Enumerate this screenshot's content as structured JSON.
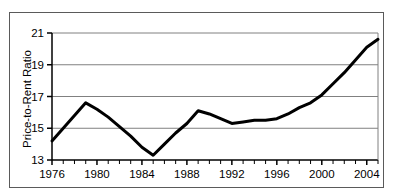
{
  "chart_data": {
    "type": "line",
    "title": "",
    "xlabel": "",
    "ylabel": "Price-to-Rent Ratio",
    "xlim": [
      1976,
      2005
    ],
    "ylim": [
      13,
      21
    ],
    "yticks": [
      13,
      15,
      17,
      19,
      21
    ],
    "ytick_labels": [
      "13",
      "15",
      "17",
      "19",
      "21"
    ],
    "xticks": [
      1976,
      1980,
      1984,
      1988,
      1992,
      1996,
      2000,
      2004
    ],
    "xtick_labels": [
      "1976",
      "1980",
      "1984",
      "1988",
      "1992",
      "1996",
      "2000",
      "2004"
    ],
    "minor_xtick_interval": 1,
    "grid": "horizontal",
    "legend": "none",
    "line_color": "#000000",
    "line_width_px": 3,
    "series": [
      {
        "name": "Price-to-Rent Ratio",
        "x": [
          1976,
          1977,
          1978,
          1979,
          1980,
          1981,
          1982,
          1983,
          1984,
          1985,
          1986,
          1987,
          1988,
          1989,
          1990,
          1991,
          1992,
          1993,
          1994,
          1995,
          1996,
          1997,
          1998,
          1999,
          2000,
          2001,
          2002,
          2003,
          2004,
          2005
        ],
        "values": [
          14.2,
          15.0,
          15.8,
          16.6,
          16.2,
          15.7,
          15.1,
          14.5,
          13.8,
          13.3,
          14.0,
          14.7,
          15.3,
          16.1,
          15.9,
          15.6,
          15.3,
          15.4,
          15.5,
          15.5,
          15.6,
          15.9,
          16.3,
          16.6,
          17.1,
          17.8,
          18.5,
          19.3,
          20.1,
          20.6
        ]
      }
    ]
  },
  "axis": {
    "ylabel": "Price-to-Rent Ratio"
  }
}
